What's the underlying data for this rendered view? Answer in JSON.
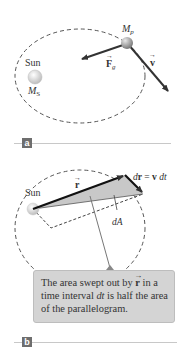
{
  "panel_a": {
    "tag": "a",
    "sun_label": "Sun",
    "sun_mass_label": "M",
    "sun_mass_sub": "S",
    "planet_mass_label": "M",
    "planet_mass_sub": "p",
    "force_label": "F",
    "force_sub": "g",
    "velocity_label": "v"
  },
  "panel_b": {
    "tag": "b",
    "sun_label": "Sun",
    "radius_label": "r",
    "dr_label_prefix": "d",
    "dr_label_vec": "r",
    "dr_label_eq": " = ",
    "dr_label_v": "v",
    "dr_label_dt": " dt",
    "area_label": "dA",
    "callout": {
      "part1": "The area swept out by ",
      "vec": "r",
      "part2": " in a time interval ",
      "dt": "dt",
      "part3": " is half the area of the parallelogram."
    }
  },
  "colors": {
    "orbit": "#555555",
    "arrow": "#333333",
    "shaded_area": "#c8c8c8",
    "callout_bg": "#d4d4d4",
    "callout_pointer": "#888888",
    "tag_bg": "#6e6e6e",
    "rule": "#c8c8c8"
  }
}
